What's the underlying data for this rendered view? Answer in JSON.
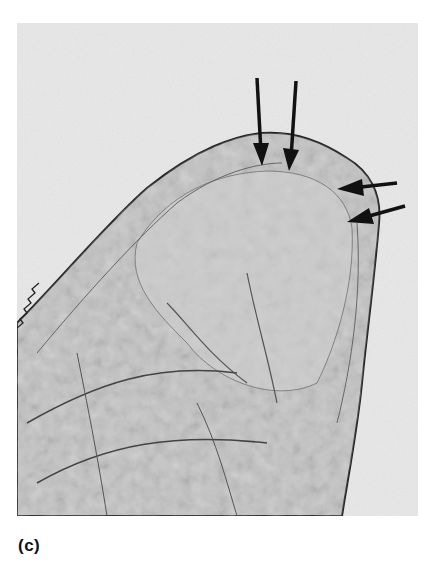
{
  "figure": {
    "panel_label": "(c)",
    "image": {
      "subject": "micrograph of nematode anterior end (head region)",
      "background_color": "#e9e9e9",
      "annotations": [
        {
          "type": "arrow",
          "direction": "down",
          "name": "arrow-1"
        },
        {
          "type": "arrow",
          "direction": "down",
          "name": "arrow-2"
        },
        {
          "type": "arrow",
          "direction": "left",
          "name": "arrow-3"
        },
        {
          "type": "arrow",
          "direction": "left",
          "name": "arrow-4"
        }
      ]
    }
  }
}
